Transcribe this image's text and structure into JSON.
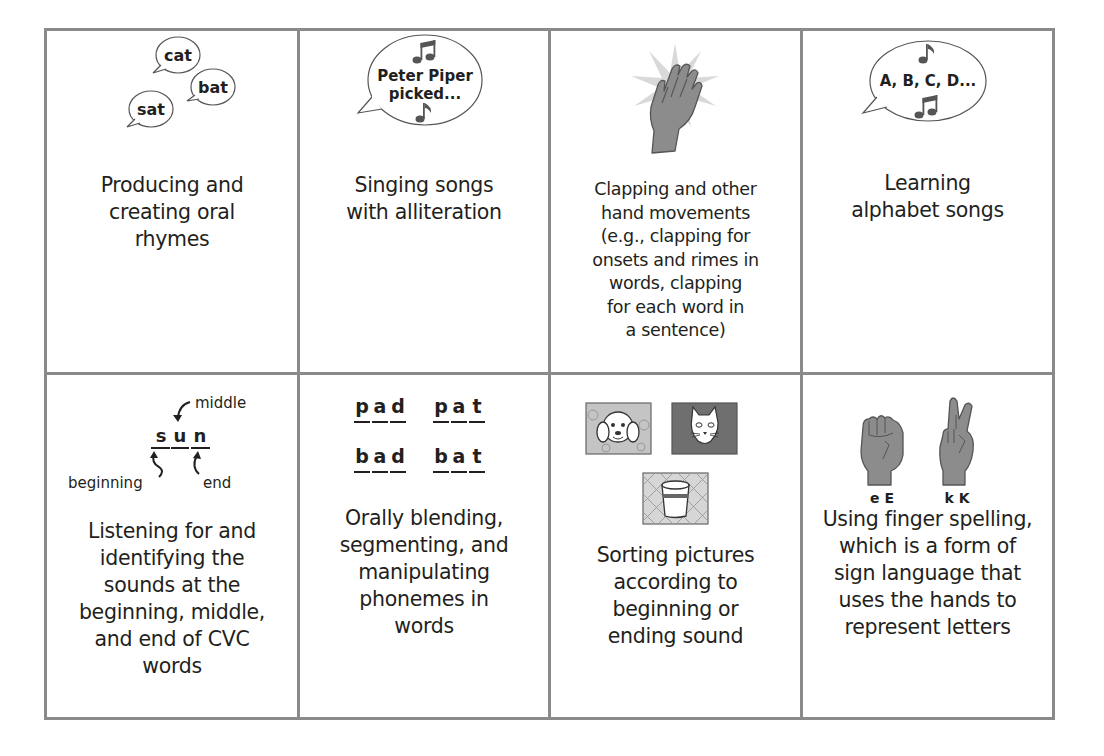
{
  "figure": {
    "layout": "4 columns x 2 rows grid of phonological awareness activities",
    "border_color": "#8a8a8a",
    "icon_gray": "#8c8c8c",
    "text_color": "#231f20"
  },
  "cells": [
    {
      "id": "oral-rhymes",
      "icon": "speech-bubbles-icon",
      "bubbles": [
        "cat",
        "bat",
        "sat"
      ],
      "caption": "Producing and\ncreating oral\nrhymes"
    },
    {
      "id": "alliteration-songs",
      "icon": "singing-bubble-icon",
      "bubble_lines": [
        "Peter Piper",
        "picked..."
      ],
      "caption": "Singing songs\nwith alliteration"
    },
    {
      "id": "clapping",
      "icon": "clapping-hand-icon",
      "caption": "Clapping and other\nhand movements\n(e.g., clapping for\nonsets and rimes in\nwords, clapping\nfor each word in\na sentence)"
    },
    {
      "id": "alphabet-songs",
      "icon": "alphabet-song-bubble-icon",
      "bubble_text": "A, B, C, D...",
      "caption": "Learning\nalphabet songs"
    },
    {
      "id": "cvc-sounds",
      "icon": "sun-word-diagram-icon",
      "word_letters": [
        "s",
        "u",
        "n"
      ],
      "labels": {
        "middle": "middle",
        "beginning": "beginning",
        "end": "end"
      },
      "caption": "Listening for and\nidentifying the\nsounds at the\nbeginning, middle,\nand end of CVC\nwords"
    },
    {
      "id": "phoneme-manipulation",
      "icon": "phoneme-words-icon",
      "words": [
        [
          "p",
          "a",
          "d"
        ],
        [
          "p",
          "a",
          "t"
        ],
        [
          "b",
          "a",
          "d"
        ],
        [
          "b",
          "a",
          "t"
        ]
      ],
      "caption": "Orally blending,\nsegmenting, and\nmanipulating\nphonemes in\nwords"
    },
    {
      "id": "picture-sorting",
      "icon": "picture-cards-icon",
      "pictures": [
        "dog",
        "cat",
        "cup"
      ],
      "caption": "Sorting pictures\naccording to\nbeginning or\nending sound"
    },
    {
      "id": "finger-spelling",
      "icon": "finger-spelling-hands-icon",
      "hand_labels": [
        "e E",
        "k K"
      ],
      "caption": "Using finger spelling,\nwhich is a form of\nsign language that\nuses the hands to\nrepresent letters"
    }
  ]
}
